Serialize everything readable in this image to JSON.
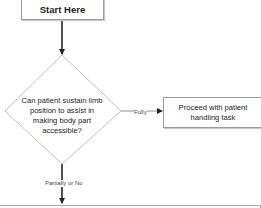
{
  "flowchart": {
    "start": {
      "label": "Start Here"
    },
    "decision": {
      "label": "Can patient sustain limb position to assist in making body part accessible?"
    },
    "yes_branch": {
      "edge_label": "Fully",
      "target": "Proceed with patient handling task"
    },
    "no_branch": {
      "edge_label": "Partially or No"
    }
  },
  "colors": {
    "node_border": "#9a9a9a",
    "arrow": "#222222",
    "diamond_stroke": "#b0b0b0"
  }
}
